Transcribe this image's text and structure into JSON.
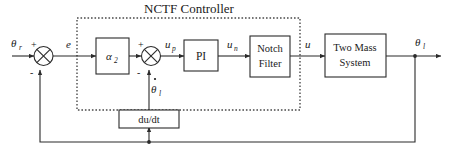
{
  "diagram": {
    "title": "NCTF Controller",
    "type": "control-block-diagram",
    "boundary": {
      "style": "dotted",
      "label": "NCTF Controller"
    },
    "blocks": [
      {
        "id": "alpha2",
        "label": "α2",
        "label_main": "α",
        "label_sub": "2",
        "shape": "rect"
      },
      {
        "id": "pi",
        "label": "PI",
        "shape": "rect"
      },
      {
        "id": "notch",
        "label_line1": "Notch",
        "label_line2": "Filter",
        "shape": "rect"
      },
      {
        "id": "plant",
        "label_line1": "Two Mass",
        "label_line2": "System",
        "shape": "rect"
      },
      {
        "id": "derivative",
        "label": "du/dt",
        "shape": "rect"
      }
    ],
    "summing_junctions": [
      {
        "id": "sum1",
        "input_sign_left": "+",
        "input_sign_bottom": "-"
      },
      {
        "id": "sum2",
        "input_sign_left": "+",
        "input_sign_bottom": "-"
      }
    ],
    "signals": [
      {
        "id": "ref",
        "label_main": "θ",
        "label_sub": "r",
        "name": "reference-input"
      },
      {
        "id": "error",
        "label_main": "e",
        "label_sub": "",
        "name": "error-signal"
      },
      {
        "id": "up",
        "label_main": "u",
        "label_sub": "p",
        "name": "up-signal"
      },
      {
        "id": "un",
        "label_main": "u",
        "label_sub": "n",
        "name": "un-signal"
      },
      {
        "id": "u",
        "label_main": "u",
        "label_sub": "",
        "name": "control-input"
      },
      {
        "id": "theta_l",
        "label_main": "θ",
        "label_sub": "l",
        "name": "output-angle"
      },
      {
        "id": "theta_l_dot",
        "label_main": "θ",
        "label_sub": "l",
        "name": "output-velocity",
        "has_dot": true
      }
    ],
    "colors": {
      "line": "#2b2b2b",
      "boundary": "#4a4a4a",
      "text": "#1a1a1a",
      "background": "#ffffff"
    }
  }
}
